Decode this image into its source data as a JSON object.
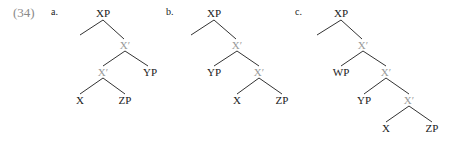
{
  "example": {
    "number": "(34)",
    "colors": {
      "node_text": "#1a1a1a",
      "bar_text": "#9a9a9a",
      "branch": "#333333",
      "example_number": "#8a8a8a"
    }
  },
  "trees": [
    {
      "label": "a.",
      "nodes": [
        {
          "id": "a-xp",
          "text": "XP",
          "x": 103,
          "y": 13,
          "type": "node"
        },
        {
          "id": "a-xbar1",
          "text": "X′",
          "x": 125,
          "y": 45,
          "type": "bar"
        },
        {
          "id": "a-xbar2",
          "text": "X′",
          "x": 103,
          "y": 72,
          "type": "bar"
        },
        {
          "id": "a-yp",
          "text": "YP",
          "x": 150,
          "y": 72,
          "type": "node"
        },
        {
          "id": "a-x",
          "text": "X",
          "x": 80,
          "y": 100,
          "type": "node"
        },
        {
          "id": "a-zp",
          "text": "ZP",
          "x": 125,
          "y": 100,
          "type": "node"
        }
      ],
      "edges": [
        [
          103,
          20,
          80,
          35
        ],
        [
          103,
          20,
          124,
          39
        ],
        [
          125,
          51,
          103,
          66
        ],
        [
          125,
          51,
          148,
          66
        ],
        [
          103,
          78,
          80,
          94
        ],
        [
          103,
          78,
          125,
          94
        ]
      ]
    },
    {
      "label": "b.",
      "nodes": [
        {
          "id": "b-xp",
          "text": "XP",
          "x": 214,
          "y": 13,
          "type": "node"
        },
        {
          "id": "b-xbar1",
          "text": "X′",
          "x": 237,
          "y": 45,
          "type": "bar"
        },
        {
          "id": "b-yp",
          "text": "YP",
          "x": 214,
          "y": 72,
          "type": "node"
        },
        {
          "id": "b-xbar2",
          "text": "X′",
          "x": 259,
          "y": 72,
          "type": "bar"
        },
        {
          "id": "b-x",
          "text": "X",
          "x": 237,
          "y": 100,
          "type": "node"
        },
        {
          "id": "b-zp",
          "text": "ZP",
          "x": 282,
          "y": 100,
          "type": "node"
        }
      ],
      "edges": [
        [
          214,
          20,
          191,
          35
        ],
        [
          214,
          20,
          236,
          39
        ],
        [
          237,
          51,
          214,
          66
        ],
        [
          237,
          51,
          259,
          66
        ],
        [
          259,
          78,
          237,
          94
        ],
        [
          259,
          78,
          282,
          94
        ]
      ]
    },
    {
      "label": "c.",
      "nodes": [
        {
          "id": "c-xp",
          "text": "XP",
          "x": 341,
          "y": 13,
          "type": "node"
        },
        {
          "id": "c-xbar1",
          "text": "X′",
          "x": 363,
          "y": 45,
          "type": "bar"
        },
        {
          "id": "c-wp",
          "text": "WP",
          "x": 341,
          "y": 72,
          "type": "node"
        },
        {
          "id": "c-xbar2",
          "text": "X′",
          "x": 386,
          "y": 72,
          "type": "bar"
        },
        {
          "id": "c-yp",
          "text": "YP",
          "x": 364,
          "y": 100,
          "type": "node"
        },
        {
          "id": "c-xbar3",
          "text": "X′",
          "x": 409,
          "y": 100,
          "type": "bar"
        },
        {
          "id": "c-x",
          "text": "X",
          "x": 386,
          "y": 128,
          "type": "node"
        },
        {
          "id": "c-zp",
          "text": "ZP",
          "x": 432,
          "y": 128,
          "type": "node"
        }
      ],
      "edges": [
        [
          341,
          20,
          317,
          35
        ],
        [
          341,
          20,
          362,
          39
        ],
        [
          363,
          51,
          341,
          66
        ],
        [
          363,
          51,
          386,
          66
        ],
        [
          386,
          78,
          364,
          94
        ],
        [
          386,
          78,
          409,
          94
        ],
        [
          409,
          106,
          386,
          122
        ],
        [
          409,
          106,
          432,
          122
        ]
      ]
    }
  ]
}
